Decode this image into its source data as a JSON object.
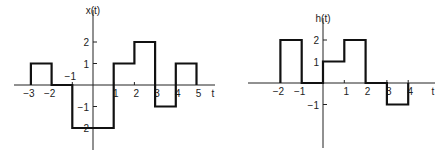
{
  "figures": [
    {
      "id": "x",
      "ylabel": "x(t)",
      "xlabel": "t",
      "origin": [
        93,
        85
      ],
      "sx": 20.7,
      "sy": 21.5,
      "xaxis": [
        14,
        215
      ],
      "yaxis": [
        10,
        150
      ],
      "xticks": [
        {
          "v": -3,
          "label": "−3"
        },
        {
          "v": -2,
          "label": "−2"
        },
        {
          "v": -1,
          "label": "−1",
          "above": true
        },
        {
          "v": 1,
          "label": "1"
        },
        {
          "v": 2,
          "label": "2"
        },
        {
          "v": 3,
          "label": "3"
        },
        {
          "v": 4,
          "label": "4"
        },
        {
          "v": 5,
          "label": "5"
        }
      ],
      "yticks": [
        {
          "v": 2,
          "label": "2"
        },
        {
          "v": 1,
          "label": "1"
        },
        {
          "v": -1,
          "label": "−1"
        },
        {
          "v": -2,
          "label": "−2"
        }
      ],
      "segments": [
        [
          -3,
          1
        ],
        [
          -2,
          0
        ],
        [
          -1,
          -2
        ],
        [
          1,
          1
        ],
        [
          2,
          2
        ],
        [
          3,
          -1
        ],
        [
          4,
          1
        ],
        [
          5,
          0
        ]
      ],
      "start": -3
    },
    {
      "id": "h",
      "ylabel": "h(t)",
      "xlabel": "t",
      "origin": [
        323,
        83
      ],
      "sx": 21.3,
      "sy": 21.5,
      "xaxis": [
        248,
        435
      ],
      "yaxis": [
        18,
        148
      ],
      "xticks": [
        {
          "v": -2,
          "label": "−2"
        },
        {
          "v": -1,
          "label": "−1"
        },
        {
          "v": 1,
          "label": "1"
        },
        {
          "v": 2,
          "label": "2"
        },
        {
          "v": 3,
          "label": "3"
        },
        {
          "v": 4,
          "label": "4"
        }
      ],
      "yticks": [
        {
          "v": 2,
          "label": "2"
        },
        {
          "v": 1,
          "label": "1"
        },
        {
          "v": -1,
          "label": "−1"
        }
      ],
      "segments": [
        [
          -2,
          2
        ],
        [
          -1,
          0
        ],
        [
          0,
          1
        ],
        [
          1,
          2
        ],
        [
          2,
          0
        ],
        [
          3,
          -1
        ],
        [
          4,
          0
        ]
      ],
      "start": -2
    }
  ]
}
